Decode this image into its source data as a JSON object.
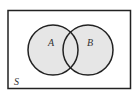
{
  "diagram": {
    "type": "venn",
    "universal_set": {
      "label": "S"
    },
    "sets": [
      {
        "label": "A"
      },
      {
        "label": "B"
      }
    ],
    "colors": {
      "stroke": "#222222",
      "fill": "#e6e6e6",
      "background": "#ffffff"
    }
  }
}
